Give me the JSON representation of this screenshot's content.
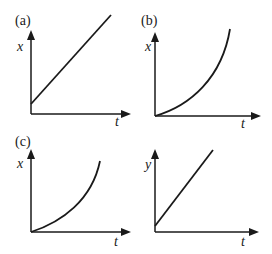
{
  "figure": {
    "panels": [
      {
        "id": "a",
        "label": "(a)",
        "x_label": "t",
        "y_label": "x",
        "curve": "linear, positive intercept"
      },
      {
        "id": "b",
        "label": "(b)",
        "x_label": "t",
        "y_label": "x",
        "curve": "concave up from origin"
      },
      {
        "id": "c",
        "label": "(c)",
        "x_label": "t",
        "y_label": "x",
        "curve": "concave up from origin"
      },
      {
        "id": "d",
        "label": "",
        "x_label": "t",
        "y_label": "y",
        "curve": "linear, small positive intercept"
      }
    ]
  }
}
